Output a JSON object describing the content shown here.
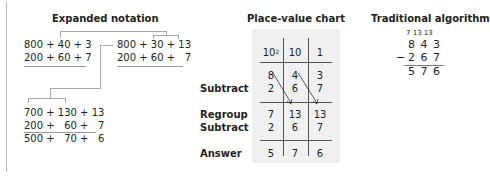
{
  "sections": {
    "expanded_notation": {
      "title": "Expanded notation",
      "step1": {
        "top": "800 + 40 + 3",
        "bottom": "200 + 60 + 7"
      },
      "step2": {
        "top": "800 + 30 + 13",
        "bottom": "200 + 60 +   7"
      },
      "step3": {
        "top": "700 + 130 + 13",
        "bottom": "200 +   60 +   7",
        "result": "500 +   70 +   6"
      }
    },
    "place_value_chart": {
      "title": "Place-value chart",
      "headers": [
        "10",
        "10",
        "1"
      ],
      "header_superscript": "2",
      "row_labels": {
        "subtract": "Subtract",
        "regroup": "Regroup",
        "subtract2": "Subtract",
        "answer": "Answer"
      },
      "rows": {
        "original": [
          "8",
          "4",
          "3"
        ],
        "subtract": [
          "2",
          "6",
          "7"
        ],
        "regroup": [
          "7",
          "13",
          "13"
        ],
        "subtract2": [
          "2",
          "6",
          "7"
        ],
        "answer": [
          "5",
          "7",
          "6"
        ]
      }
    },
    "traditional_algorithm": {
      "title": "Traditional algorithm",
      "regroup_marks": "7 13 13",
      "minuend": "8 4 3",
      "subtrahend": "2 6 7",
      "minus_sign": "−",
      "difference": "5 7 6"
    }
  },
  "colors": {
    "text": "#231f20",
    "lines": "#a8a8a8",
    "panel_bg": "#f0f0f0"
  }
}
